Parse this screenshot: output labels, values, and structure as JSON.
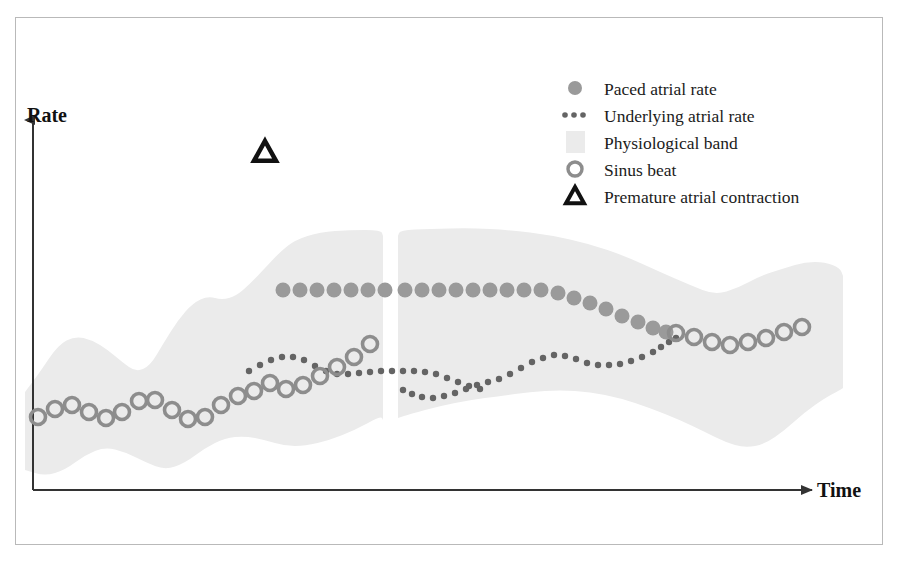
{
  "figure": {
    "title": "",
    "frame_color": "#b9b9b9",
    "background": "#ffffff"
  },
  "axes": {
    "y_label": "Rate",
    "x_label": "Time",
    "axis_color": "#333333",
    "origin": {
      "x": 33,
      "y": 490
    },
    "y_top": 120,
    "x_right": 812
  },
  "legend": {
    "position": "top-right",
    "x": 575,
    "y": 88,
    "row_height": 27,
    "items": [
      {
        "label": "Paced atrial rate",
        "marker": "filled-circle",
        "color": "#9a9a9a"
      },
      {
        "label": "Underlying atrial rate",
        "marker": "dotted-line",
        "color": "#646464"
      },
      {
        "label": "Physiological band",
        "marker": "band-swatch",
        "color": "#ebebeb"
      },
      {
        "label": "Sinus beat",
        "marker": "open-circle",
        "color": "#8d8d8d"
      },
      {
        "label": "Premature atrial contraction",
        "marker": "triangle-outline",
        "color": "#111111"
      }
    ]
  },
  "annotations": [
    {
      "name": "premature-atrial-contraction-marker",
      "marker": "triangle-outline",
      "x": 265,
      "y": 152,
      "color": "#111111",
      "label": "Premature atrial contraction"
    }
  ],
  "chart_data": {
    "type": "scatter",
    "title": "",
    "xlabel": "Time",
    "ylabel": "Rate",
    "grid": false,
    "legend_position": "top-right",
    "axis_note": "Unitless schematic axes; values are pixel-space coordinates read from the figure (y increases downward on screen, so lower y = higher rate).",
    "colors": {
      "paced_atrial_rate": "#9a9a9a",
      "underlying_atrial_rate": "#646464",
      "physiological_band": "#ebebeb",
      "sinus_beat": "#8d8d8d",
      "premature_atrial_contraction": "#111111"
    },
    "series": [
      {
        "name": "Physiological band",
        "type": "area",
        "fill": "#ebebeb",
        "segments": [
          {
            "name": "band-segment-left",
            "upper": [
              [
                25,
                392
              ],
              [
                40,
                372
              ],
              [
                58,
                345
              ],
              [
                75,
                336
              ],
              [
                92,
                340
              ],
              [
                108,
                350
              ],
              [
                122,
                362
              ],
              [
                136,
                372
              ],
              [
                150,
                366
              ],
              [
                163,
                344
              ],
              [
                178,
                320
              ],
              [
                193,
                303
              ],
              [
                208,
                296
              ],
              [
                222,
                300
              ],
              [
                236,
                296
              ],
              [
                250,
                284
              ],
              [
                265,
                268
              ],
              [
                280,
                252
              ],
              [
                295,
                240
              ],
              [
                320,
                232
              ],
              [
                350,
                230
              ],
              [
                381,
                230
              ],
              [
                383,
                236
              ]
            ],
            "lower": [
              [
                25,
                470
              ],
              [
                45,
                476
              ],
              [
                65,
                470
              ],
              [
                85,
                455
              ],
              [
                105,
                447
              ],
              [
                125,
                452
              ],
              [
                145,
                462
              ],
              [
                165,
                470
              ],
              [
                185,
                463
              ],
              [
                205,
                448
              ],
              [
                225,
                438
              ],
              [
                245,
                436
              ],
              [
                265,
                440
              ],
              [
                285,
                446
              ],
              [
                305,
                446
              ],
              [
                330,
                440
              ],
              [
                355,
                430
              ],
              [
                381,
                416
              ],
              [
                383,
                420
              ]
            ]
          },
          {
            "name": "band-segment-right",
            "upper": [
              [
                398,
                236
              ],
              [
                400,
                230
              ],
              [
                430,
                229
              ],
              [
                470,
                228
              ],
              [
                510,
                230
              ],
              [
                550,
                235
              ],
              [
                590,
                244
              ],
              [
                625,
                256
              ],
              [
                660,
                272
              ],
              [
                690,
                285
              ],
              [
                715,
                295
              ],
              [
                738,
                288
              ],
              [
                760,
                276
              ],
              [
                785,
                268
              ],
              [
                805,
                262
              ],
              [
                825,
                262
              ],
              [
                840,
                268
              ],
              [
                843,
                276
              ]
            ],
            "lower": [
              [
                398,
                418
              ],
              [
                410,
                414
              ],
              [
                440,
                406
              ],
              [
                470,
                400
              ],
              [
                500,
                396
              ],
              [
                530,
                392
              ],
              [
                560,
                390
              ],
              [
                590,
                392
              ],
              [
                620,
                398
              ],
              [
                650,
                408
              ],
              [
                680,
                420
              ],
              [
                705,
                432
              ],
              [
                725,
                442
              ],
              [
                745,
                448
              ],
              [
                765,
                444
              ],
              [
                785,
                430
              ],
              [
                805,
                412
              ],
              [
                825,
                398
              ],
              [
                840,
                390
              ],
              [
                843,
                388
              ]
            ]
          }
        ]
      },
      {
        "name": "Sinus beat",
        "type": "scatter",
        "marker": "open-circle",
        "radius": 7.5,
        "color": "#8d8d8d",
        "points": [
          [
            38,
            417
          ],
          [
            55,
            409
          ],
          [
            72,
            405
          ],
          [
            89,
            412
          ],
          [
            106,
            418
          ],
          [
            122,
            412
          ],
          [
            139,
            401
          ],
          [
            155,
            400
          ],
          [
            172,
            410
          ],
          [
            188,
            419
          ],
          [
            205,
            417
          ],
          [
            221,
            405
          ],
          [
            238,
            396
          ],
          [
            254,
            391
          ],
          [
            270,
            383
          ],
          [
            286,
            389
          ],
          [
            303,
            385
          ],
          [
            320,
            376
          ],
          [
            337,
            367
          ],
          [
            354,
            357
          ],
          [
            370,
            344
          ],
          [
            676,
            333
          ],
          [
            694,
            337
          ],
          [
            712,
            342
          ],
          [
            730,
            345
          ],
          [
            748,
            342
          ],
          [
            766,
            338
          ],
          [
            784,
            332
          ],
          [
            802,
            327
          ]
        ]
      },
      {
        "name": "Paced atrial rate",
        "type": "scatter",
        "marker": "filled-circle",
        "radius": 7.5,
        "color": "#9a9a9a",
        "points": [
          [
            283,
            290
          ],
          [
            300,
            290
          ],
          [
            317,
            290
          ],
          [
            334,
            290
          ],
          [
            351,
            290
          ],
          [
            368,
            290
          ],
          [
            385,
            290
          ],
          [
            405,
            290
          ],
          [
            422,
            290
          ],
          [
            439,
            290
          ],
          [
            456,
            290
          ],
          [
            473,
            290
          ],
          [
            490,
            290
          ],
          [
            507,
            290
          ],
          [
            524,
            290
          ],
          [
            541,
            290
          ],
          [
            558,
            293
          ],
          [
            574,
            298
          ],
          [
            590,
            303
          ],
          [
            606,
            309
          ],
          [
            622,
            316
          ],
          [
            638,
            322
          ],
          [
            653,
            328
          ],
          [
            666,
            332
          ]
        ]
      },
      {
        "name": "Underlying atrial rate",
        "type": "line",
        "marker": "dotted",
        "dot_radius": 3.2,
        "color": "#646464",
        "segments": [
          {
            "name": "underlying-segment-left",
            "points": [
              [
                249,
                371
              ],
              [
                260,
                365
              ],
              [
                271,
                360
              ],
              [
                282,
                357
              ],
              [
                293,
                357
              ],
              [
                304,
                360
              ],
              [
                315,
                366
              ],
              [
                326,
                371
              ],
              [
                337,
                374
              ],
              [
                348,
                374
              ],
              [
                359,
                373
              ],
              [
                370,
                372
              ],
              [
                381,
                371
              ],
              [
                392,
                371
              ],
              [
                403,
                371
              ],
              [
                414,
                371
              ],
              [
                425,
                372
              ],
              [
                436,
                374
              ],
              [
                447,
                378
              ],
              [
                458,
                382
              ],
              [
                469,
                386
              ],
              [
                480,
                389
              ]
            ]
          },
          {
            "name": "underlying-segment-right",
            "points": [
              [
                403,
                390
              ],
              [
                412,
                394
              ],
              [
                422,
                397
              ],
              [
                433,
                398
              ],
              [
                444,
                396
              ],
              [
                455,
                393
              ],
              [
                466,
                389
              ],
              [
                477,
                385
              ],
              [
                488,
                382
              ],
              [
                499,
                379
              ],
              [
                510,
                374
              ],
              [
                521,
                368
              ],
              [
                532,
                362
              ],
              [
                543,
                358
              ],
              [
                554,
                355
              ],
              [
                565,
                356
              ],
              [
                576,
                359
              ],
              [
                587,
                363
              ],
              [
                598,
                365
              ],
              [
                609,
                365
              ],
              [
                620,
                364
              ],
              [
                631,
                361
              ],
              [
                642,
                357
              ],
              [
                653,
                352
              ],
              [
                661,
                347
              ],
              [
                669,
                342
              ],
              [
                676,
                338
              ]
            ]
          }
        ]
      }
    ]
  }
}
